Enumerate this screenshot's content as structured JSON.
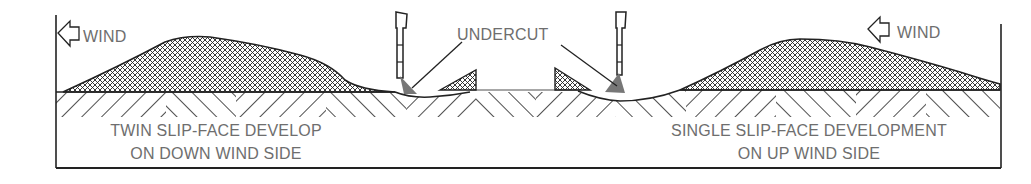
{
  "diagram": {
    "labels": {
      "wind_left": "WIND",
      "wind_right": "WIND",
      "undercut": "UNDERCUT",
      "left_caption_line1": "TWIN SLIP-FACE DEVELOP",
      "left_caption_line2": "ON DOWN WIND SIDE",
      "right_caption_line1": "SINGLE SLIP-FACE DEVELOPMENT",
      "right_caption_line2": "ON UP WIND SIDE"
    },
    "icons": {
      "wind_arrow_left": "left-arrow-outline",
      "wind_arrow_right": "left-arrow-outline",
      "cutter_left": "cutting-bit",
      "cutter_right": "cutting-bit"
    },
    "colors": {
      "line": "#222222",
      "text": "#6e6e6e",
      "undercut_fill": "#777777",
      "background": "#ffffff"
    }
  }
}
